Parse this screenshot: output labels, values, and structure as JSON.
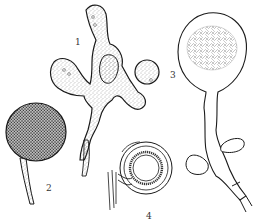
{
  "figure": {
    "background": "#ffffff",
    "ink_color": "#1a1a1a",
    "stipple_color": "#555555",
    "labels": [
      {
        "id": "1",
        "text": "1",
        "x": 75,
        "y": 38
      },
      {
        "id": "2",
        "text": "2",
        "x": 46,
        "y": 184
      },
      {
        "id": "3",
        "text": "3",
        "x": 170,
        "y": 71
      },
      {
        "id": "4",
        "text": "4",
        "x": 146,
        "y": 212
      }
    ],
    "structures": [
      {
        "id": "1",
        "description": "branched lobed thallus with stippled texture"
      },
      {
        "id": "2",
        "description": "spherical stippled sporangium on stalk"
      },
      {
        "id": "3",
        "description": "round vesicle attached to thallus"
      },
      {
        "id": "4",
        "description": "ringed spore with attached hypha, in cross-section"
      },
      {
        "id": "tall",
        "description": "large globular sporangium on long branching stalk with side vesicles"
      }
    ]
  }
}
